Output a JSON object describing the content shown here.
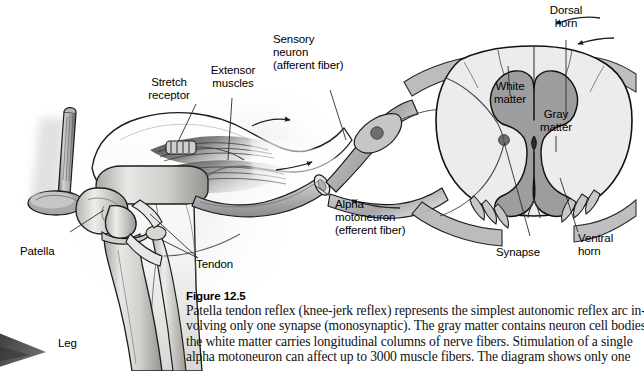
{
  "figure": {
    "number_label": "Figure 12.5",
    "caption_lines": [
      "Patella tendon reflex (knee-jerk reflex) represents the simplest autonomic reflex arc in-",
      "volving only one synapse (monosynaptic). The gray matter contains neuron cell bodies",
      "the white matter carries longitudinal columns of nerve fibers. Stimulation of a single",
      "alpha motoneuron can affect up to 3000 muscle fibers. The diagram shows only one"
    ]
  },
  "labels": {
    "patella": "Patella",
    "leg": "Leg",
    "stretch_receptor": "Stretch\nreceptor",
    "extensor_muscles": "Extensor\nmuscles",
    "sensory_neuron": "Sensory\nneuron\n(afferent fiber)",
    "alpha_motoneuron": "Alpha\nmotoneuron\n(efferent fiber)",
    "tendon": "Tendon",
    "dorsal_horn": "Dorsal\nhorn",
    "white_matter": "White\nmatter",
    "gray_matter": "Gray\nmatter",
    "synapse": "Synapse",
    "ventral_horn": "Ventral\nhorn"
  },
  "colors": {
    "background": "#ffffff",
    "ink": "#000000",
    "outline": "#1a1a1a",
    "white_matter_fill": "#ececed",
    "gray_matter_fill": "#9d9d9f",
    "nerve_fill": "#c3c3c5",
    "nerve_fill_dark": "#8f8f92",
    "bone_light": "#e3e2e0",
    "bone_mid": "#c2c0bd",
    "bone_shadow": "#8e8c89",
    "muscle_dark": "#4a4a4a",
    "muscle_mid": "#7d7d7d",
    "cell_body": "#6e6e70",
    "foot_wedge": "#4e4e50",
    "leader_line": "#2b2b2b"
  }
}
